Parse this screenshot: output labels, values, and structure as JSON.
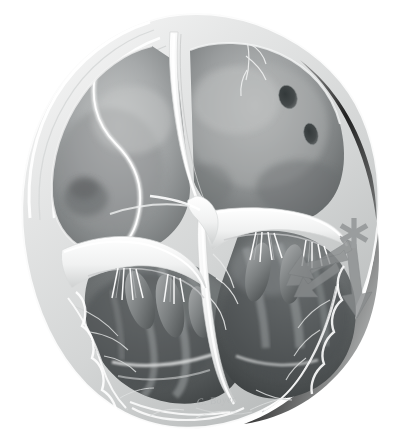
{
  "image": {
    "kind": "medical-illustration",
    "subject": "Heart, four-chamber cross-section (base view)",
    "style": "grayscale airbrush anatomical drawing",
    "background_color": "#ffffff",
    "width": 399,
    "height": 438
  },
  "palette": {
    "background": "#ffffff",
    "myocardium_light": "#e9eaea",
    "myocardium_mid": "#cfd1d1",
    "myocardium_shadow": "#a9acac",
    "chamber_light": "#b9bbbb",
    "chamber_mid": "#8e9192",
    "chamber_dark": "#5e6162",
    "chamber_deepest": "#3f4344",
    "valve_white": "#f6f7f7",
    "valve_shadow": "#c6c8c8",
    "marker_gray": "#9a9d9e",
    "arrow_gray": "#8a8d8e",
    "ostium_dark": "#4a4e4f",
    "signature_gray": "#b9bcbd"
  },
  "annotations": {
    "asterisk": {
      "name": "asterisk-marker",
      "glyph": "*",
      "points": 6,
      "color": "#9a9d9e",
      "x": 354,
      "y": 233
    },
    "arrows": [
      {
        "name": "flow-arrow-1",
        "color": "#8a8d8e",
        "from": [
          352,
          243
        ],
        "to": [
          300,
          283
        ]
      },
      {
        "name": "flow-arrow-2",
        "color": "#8a8d8e",
        "from": [
          352,
          246
        ],
        "to": [
          306,
          270
        ]
      },
      {
        "name": "flow-arrow-3",
        "color": "#8a8d8e",
        "from": [
          345,
          249
        ],
        "to": [
          296,
          260
        ]
      },
      {
        "name": "flow-arrow-4",
        "color": "#8a8d8e",
        "from": [
          341,
          238
        ],
        "to": [
          358,
          298
        ]
      }
    ]
  },
  "structures": [
    {
      "id": "right-atrium",
      "label": "Right atrium",
      "region": "upper-left"
    },
    {
      "id": "left-atrium",
      "label": "Left atrium",
      "region": "upper-right"
    },
    {
      "id": "right-ventricle",
      "label": "Right ventricle",
      "region": "lower-left"
    },
    {
      "id": "left-ventricle",
      "label": "Left ventricle",
      "region": "lower-right"
    },
    {
      "id": "interatrial-septum",
      "label": "Interatrial septum",
      "region": "upper-centre"
    },
    {
      "id": "tricuspid-valve",
      "label": "Tricuspid valve leaflets",
      "region": "mid-left"
    },
    {
      "id": "mitral-valve",
      "label": "Mitral valve leaflets",
      "region": "mid-right"
    },
    {
      "id": "chordae-tendineae",
      "label": "Chordae tendineae",
      "region": "mid"
    },
    {
      "id": "papillary-muscles",
      "label": "Papillary muscles",
      "region": "lower"
    },
    {
      "id": "trabeculae-carneae",
      "label": "Trabeculae carneae",
      "region": "lower"
    },
    {
      "id": "pulmonary-vein-ostia",
      "label": "Pulmonary vein ostia",
      "region": "upper-right"
    },
    {
      "id": "coronary-vessels",
      "label": "Coronary vessels",
      "region": "epicardium"
    },
    {
      "id": "myocardial-wall",
      "label": "Myocardial wall",
      "region": "perimeter"
    }
  ],
  "signature": {
    "text": "C. Boyer",
    "color": "#b9bcbd"
  }
}
